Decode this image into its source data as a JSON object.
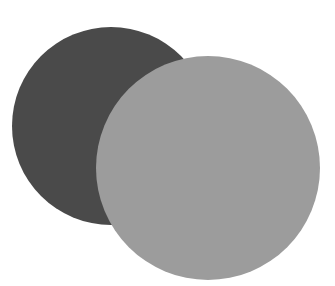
{
  "canvas": {
    "width": 335,
    "height": 286,
    "background": "#ffffff"
  },
  "shapes": [
    {
      "id": "dark-circle",
      "type": "circle",
      "cx": 111,
      "cy": 126,
      "r": 99,
      "fill": "#4a4a4a"
    },
    {
      "id": "light-circle",
      "type": "circle",
      "cx": 208,
      "cy": 168,
      "r": 112,
      "fill": "#9c9c9c"
    }
  ]
}
